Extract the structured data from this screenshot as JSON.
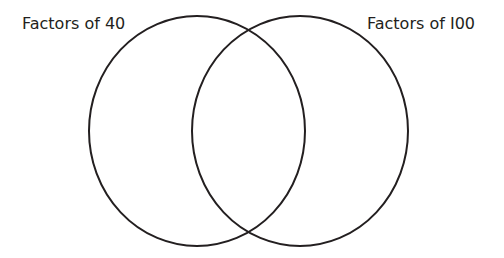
{
  "diagram": {
    "type": "venn",
    "sets": [
      {
        "label": "Factors of 40",
        "cx": 197,
        "cy": 131,
        "rx": 108,
        "ry": 115
      },
      {
        "label": "Factors of I00",
        "cx": 300,
        "cy": 131,
        "rx": 108,
        "ry": 115
      }
    ],
    "stroke_color": "#231f20",
    "stroke_width": 2,
    "background": "#ffffff"
  }
}
